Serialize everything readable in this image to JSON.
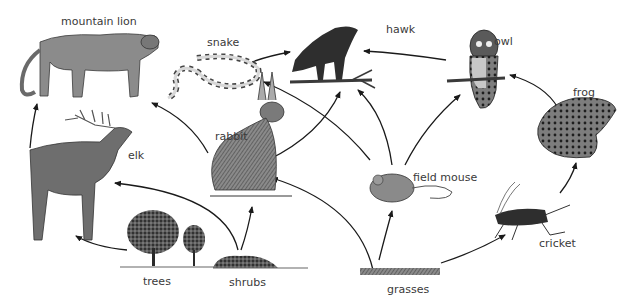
{
  "diagram": {
    "type": "food-web",
    "organisms": {
      "mountain_lion": {
        "label": "mountain lion",
        "role": "tertiary consumer"
      },
      "snake": {
        "label": "snake",
        "role": "secondary consumer"
      },
      "hawk": {
        "label": "hawk",
        "role": "tertiary consumer"
      },
      "owl": {
        "label": "owl",
        "role": "tertiary consumer"
      },
      "frog": {
        "label": "frog",
        "role": "secondary consumer"
      },
      "rabbit": {
        "label": "rabbit",
        "role": "primary consumer"
      },
      "elk": {
        "label": "elk",
        "role": "primary consumer"
      },
      "field_mouse": {
        "label": "field mouse",
        "role": "primary consumer"
      },
      "cricket": {
        "label": "cricket",
        "role": "primary consumer"
      },
      "trees": {
        "label": "trees",
        "role": "producer"
      },
      "shrubs": {
        "label": "shrubs",
        "role": "producer"
      },
      "grasses": {
        "label": "grasses",
        "role": "producer"
      }
    },
    "edges": [
      {
        "from": "trees",
        "to": "elk"
      },
      {
        "from": "shrubs",
        "to": "elk"
      },
      {
        "from": "shrubs",
        "to": "rabbit"
      },
      {
        "from": "grasses",
        "to": "rabbit"
      },
      {
        "from": "grasses",
        "to": "field_mouse"
      },
      {
        "from": "grasses",
        "to": "cricket"
      },
      {
        "from": "elk",
        "to": "mountain_lion"
      },
      {
        "from": "rabbit",
        "to": "mountain_lion"
      },
      {
        "from": "rabbit",
        "to": "hawk"
      },
      {
        "from": "snake",
        "to": "hawk"
      },
      {
        "from": "field_mouse",
        "to": "snake"
      },
      {
        "from": "field_mouse",
        "to": "hawk"
      },
      {
        "from": "field_mouse",
        "to": "owl"
      },
      {
        "from": "owl",
        "to": "hawk"
      },
      {
        "from": "cricket",
        "to": "frog"
      },
      {
        "from": "frog",
        "to": "owl"
      }
    ]
  },
  "colors": {
    "background": "#ffffff",
    "arrow": "#1a1a1a",
    "label": "#3a3a3a",
    "illustration_dark": "#2b2b2b",
    "illustration_mid": "#7a7a7a",
    "illustration_light": "#c8c8c8"
  }
}
